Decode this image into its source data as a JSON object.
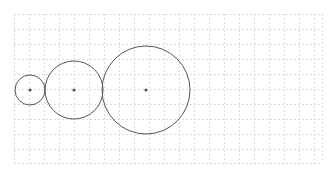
{
  "diagram": {
    "type": "tangent-circles",
    "background": "#ffffff",
    "grid": {
      "x0": 14,
      "y0": 14,
      "x1": 322,
      "y1": 163,
      "spacing": 15,
      "color": "#dcdcdc",
      "dash": "2,2"
    },
    "stroke_color": "#555555",
    "center_color": "#555555",
    "circles": [
      {
        "name": "small-circle",
        "cx": 30,
        "cy": 90,
        "r": 15
      },
      {
        "name": "medium-circle",
        "cx": 74,
        "cy": 90,
        "r": 29
      },
      {
        "name": "large-circle",
        "cx": 146,
        "cy": 90,
        "r": 44
      }
    ]
  }
}
